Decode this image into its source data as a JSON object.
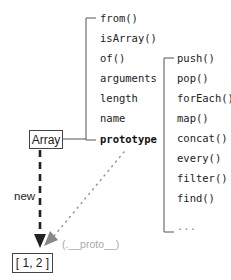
{
  "diagram": {
    "constructor_box": "Array",
    "instance_box": "[ 1, 2 ]",
    "new_label": "new",
    "proto_label": "(.__proto__)",
    "static_members": [
      "from()",
      "isArray()",
      "of()",
      "arguments",
      "length",
      "name",
      "prototype"
    ],
    "prototype_methods": [
      "push()",
      "pop()",
      "forEach()",
      "map()",
      "concat()",
      "every()",
      "filter()",
      "find()",
      "..."
    ],
    "colors": {
      "line": "#555555",
      "new_arrow": "#222222",
      "proto_arrow": "#999999",
      "proto_text": "#aaaaaa"
    }
  }
}
